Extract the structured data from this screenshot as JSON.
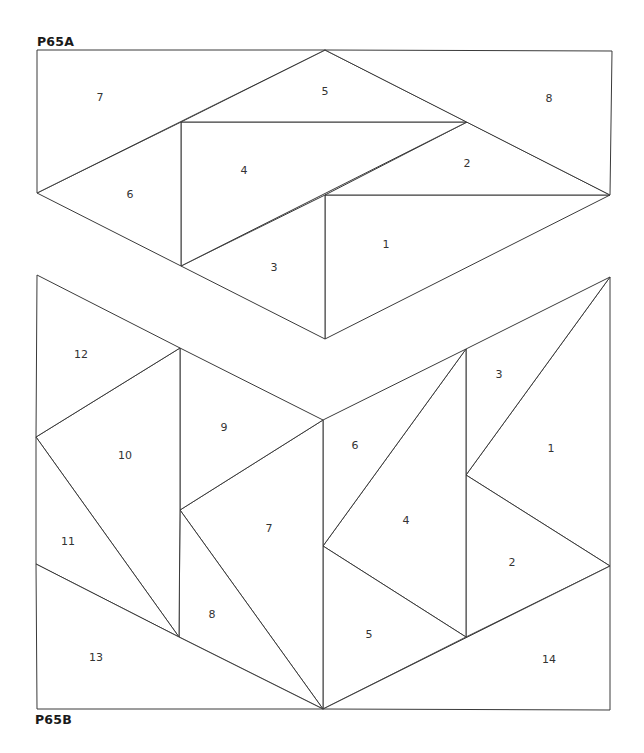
{
  "sections": [
    {
      "id": "A",
      "label": "P65A",
      "pieces": [
        {
          "num": "1",
          "points": [
            [
              325,
              195
            ],
            [
              610,
              195
            ],
            [
              325,
              339
            ]
          ],
          "label_pos": [
            386,
            245
          ]
        },
        {
          "num": "2",
          "points": [
            [
              325,
              195
            ],
            [
              467,
              122
            ],
            [
              610,
              195
            ]
          ],
          "label_pos": [
            467,
            164
          ]
        },
        {
          "num": "3",
          "points": [
            [
              181,
              266
            ],
            [
              325,
              195
            ],
            [
              325,
              339
            ]
          ],
          "label_pos": [
            274,
            268
          ]
        },
        {
          "num": "4",
          "points": [
            [
              181,
              122
            ],
            [
              467,
              122
            ],
            [
              181,
              266
            ]
          ],
          "label_pos": [
            244,
            171
          ]
        },
        {
          "num": "5",
          "points": [
            [
              181,
              122
            ],
            [
              325,
              50
            ],
            [
              467,
              122
            ]
          ],
          "label_pos": [
            325,
            92
          ]
        },
        {
          "num": "6",
          "points": [
            [
              37,
              193
            ],
            [
              181,
              122
            ],
            [
              181,
              266
            ]
          ],
          "label_pos": [
            130,
            195
          ]
        },
        {
          "num": "7",
          "points": [
            [
              37,
              50
            ],
            [
              325,
              50
            ],
            [
              37,
              193
            ]
          ],
          "label_pos": [
            100,
            98
          ]
        },
        {
          "num": "8",
          "points": [
            [
              325,
              50
            ],
            [
              612,
              51
            ],
            [
              610,
              195
            ]
          ],
          "label_pos": [
            549,
            99
          ]
        }
      ]
    },
    {
      "id": "B",
      "label": "P65B",
      "pieces": [
        {
          "num": "1",
          "points": [
            [
              610,
              277
            ],
            [
              610,
              566
            ],
            [
              466,
              475
            ]
          ],
          "label_pos": [
            551,
            449
          ]
        },
        {
          "num": "2",
          "points": [
            [
              466,
              475
            ],
            [
              610,
              566
            ],
            [
              466,
              637
            ]
          ],
          "label_pos": [
            512,
            563
          ]
        },
        {
          "num": "3",
          "points": [
            [
              466,
              349
            ],
            [
              610,
              277
            ],
            [
              466,
              475
            ]
          ],
          "label_pos": [
            499,
            375
          ]
        },
        {
          "num": "4",
          "points": [
            [
              323,
              546
            ],
            [
              466,
              349
            ],
            [
              466,
              637
            ]
          ],
          "label_pos": [
            406,
            521
          ]
        },
        {
          "num": "5",
          "points": [
            [
              323,
              546
            ],
            [
              466,
              637
            ],
            [
              323,
              709
            ]
          ],
          "label_pos": [
            369,
            635
          ]
        },
        {
          "num": "6",
          "points": [
            [
              323,
              420
            ],
            [
              466,
              349
            ],
            [
              323,
              546
            ]
          ],
          "label_pos": [
            355,
            446
          ]
        },
        {
          "num": "7",
          "points": [
            [
              180,
              510
            ],
            [
              323,
              420
            ],
            [
              323,
              709
            ]
          ],
          "label_pos": [
            269,
            529
          ]
        },
        {
          "num": "8",
          "points": [
            [
              180,
              510
            ],
            [
              323,
              709
            ],
            [
              179,
              637
            ]
          ],
          "label_pos": [
            212,
            615
          ]
        },
        {
          "num": "9",
          "points": [
            [
              180,
              348
            ],
            [
              323,
              420
            ],
            [
              180,
              510
            ]
          ],
          "label_pos": [
            224,
            428
          ]
        },
        {
          "num": "10",
          "points": [
            [
              36,
              437
            ],
            [
              180,
              348
            ],
            [
              180,
              510
            ],
            [
              179,
              637
            ]
          ],
          "label_pos": [
            125,
            456
          ]
        },
        {
          "num": "11",
          "points": [
            [
              36,
              437
            ],
            [
              179,
              637
            ],
            [
              36,
              564
            ]
          ],
          "label_pos": [
            68,
            542
          ]
        },
        {
          "num": "12",
          "points": [
            [
              37,
              275
            ],
            [
              180,
              348
            ],
            [
              36,
              437
            ]
          ],
          "label_pos": [
            81,
            355
          ]
        },
        {
          "num": "13",
          "points": [
            [
              36,
              564
            ],
            [
              179,
              637
            ],
            [
              323,
              709
            ],
            [
              37,
              709
            ]
          ],
          "label_pos": [
            96,
            658
          ]
        },
        {
          "num": "14",
          "points": [
            [
              323,
              709
            ],
            [
              610,
              566
            ],
            [
              610,
              710
            ]
          ],
          "label_pos": [
            549,
            660
          ]
        }
      ]
    }
  ],
  "colors": {
    "line": "#3a3a3a",
    "fill": "#ffffff",
    "text": "#333333"
  }
}
